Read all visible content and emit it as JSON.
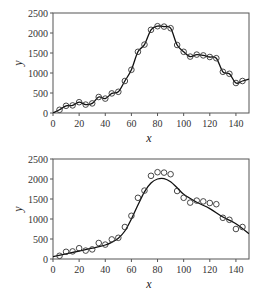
{
  "chart_data": [
    {
      "type": "scatter",
      "title": "",
      "xlabel": "x",
      "ylabel": "y",
      "xlim": [
        0,
        150
      ],
      "ylim": [
        0,
        2500
      ],
      "xticks": [
        0,
        20,
        40,
        60,
        80,
        100,
        120,
        140
      ],
      "yticks": [
        0,
        500,
        1000,
        1500,
        2000,
        2500
      ],
      "grid": false,
      "legend": null,
      "series": [
        {
          "name": "observations",
          "marker": "open-circle",
          "x": [
            5,
            10,
            15,
            20,
            25,
            30,
            35,
            40,
            45,
            50,
            55,
            60,
            65,
            70,
            75,
            80,
            85,
            90,
            95,
            100,
            105,
            110,
            115,
            120,
            125,
            130,
            135,
            140,
            145
          ],
          "y": [
            80,
            180,
            190,
            270,
            210,
            240,
            400,
            360,
            490,
            530,
            800,
            1080,
            1530,
            1710,
            2080,
            2170,
            2160,
            2120,
            1700,
            1530,
            1410,
            1460,
            1440,
            1400,
            1370,
            1030,
            980,
            750,
            800
          ]
        },
        {
          "name": "interpolating-curve",
          "line": "solid",
          "x": [
            0,
            5,
            10,
            15,
            20,
            25,
            30,
            35,
            40,
            45,
            50,
            55,
            60,
            65,
            70,
            75,
            80,
            85,
            90,
            95,
            100,
            105,
            110,
            115,
            120,
            125,
            130,
            135,
            140,
            145,
            150
          ],
          "y": [
            0,
            80,
            180,
            190,
            270,
            210,
            240,
            400,
            360,
            490,
            530,
            800,
            1080,
            1530,
            1710,
            2080,
            2170,
            2160,
            2120,
            1700,
            1530,
            1410,
            1460,
            1440,
            1400,
            1370,
            1030,
            980,
            750,
            800,
            850
          ]
        }
      ]
    },
    {
      "type": "scatter",
      "title": "",
      "xlabel": "x",
      "ylabel": "y",
      "xlim": [
        0,
        150
      ],
      "ylim": [
        0,
        2500
      ],
      "xticks": [
        0,
        20,
        40,
        60,
        80,
        100,
        120,
        140
      ],
      "yticks": [
        0,
        500,
        1000,
        1500,
        2000,
        2500
      ],
      "grid": false,
      "legend": null,
      "series": [
        {
          "name": "observations",
          "marker": "open-circle",
          "x": [
            5,
            10,
            15,
            20,
            25,
            30,
            35,
            40,
            45,
            50,
            55,
            60,
            65,
            70,
            75,
            80,
            85,
            90,
            95,
            100,
            105,
            110,
            115,
            120,
            125,
            130,
            135,
            140,
            145
          ],
          "y": [
            80,
            180,
            190,
            270,
            210,
            240,
            400,
            360,
            490,
            530,
            800,
            1080,
            1530,
            1710,
            2080,
            2170,
            2160,
            2120,
            1700,
            1530,
            1410,
            1460,
            1440,
            1400,
            1370,
            1030,
            980,
            750,
            800
          ]
        },
        {
          "name": "smooth-fit-curve",
          "line": "solid",
          "x": [
            0,
            10,
            20,
            30,
            40,
            45,
            50,
            55,
            60,
            65,
            70,
            75,
            80,
            85,
            90,
            95,
            100,
            110,
            120,
            130,
            140,
            150
          ],
          "y": [
            60,
            130,
            200,
            270,
            350,
            420,
            520,
            700,
            1000,
            1350,
            1680,
            1900,
            2000,
            2010,
            1930,
            1780,
            1620,
            1420,
            1260,
            1050,
            880,
            630
          ]
        }
      ]
    }
  ]
}
